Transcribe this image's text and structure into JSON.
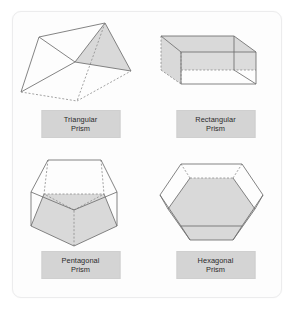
{
  "card": {
    "background_color": "#fdfdfd",
    "border_color": "#ececed"
  },
  "style": {
    "edge_color": "#6e6e6e",
    "hidden_edge_color": "#8c8c8c",
    "face_fill": "#d9d9d9",
    "label_background": "#d4d4d4",
    "label_border": "#cfcfcf",
    "label_text_color": "#2b2b2b"
  },
  "figures": [
    {
      "id": "triangular-prism",
      "label_line1": "Triangular",
      "label_line2": "Prism",
      "shape": "triangular prism",
      "faces": 5,
      "edges": 9,
      "vertices": 6,
      "shaded_face": "right triangular base",
      "hidden_edges_style": "dashed"
    },
    {
      "id": "rectangular-prism",
      "label_line1": "Rectangular",
      "label_line2": "Prism",
      "shape": "rectangular prism",
      "faces": 6,
      "edges": 12,
      "vertices": 8,
      "shaded_face": "top and back faces",
      "hidden_edges_style": "dashed"
    },
    {
      "id": "pentagonal-prism",
      "label_line1": "Pentagonal",
      "label_line2": "Prism",
      "shape": "pentagonal prism",
      "faces": 7,
      "edges": 15,
      "vertices": 10,
      "shaded_face": "front pentagonal base",
      "hidden_edges_style": "dashed"
    },
    {
      "id": "hexagonal-prism",
      "label_line1": "Hexagonal",
      "label_line2": "Prism",
      "shape": "hexagonal prism",
      "faces": 8,
      "edges": 18,
      "vertices": 12,
      "shaded_face": "front hexagonal base",
      "hidden_edges_style": "dashed"
    }
  ]
}
